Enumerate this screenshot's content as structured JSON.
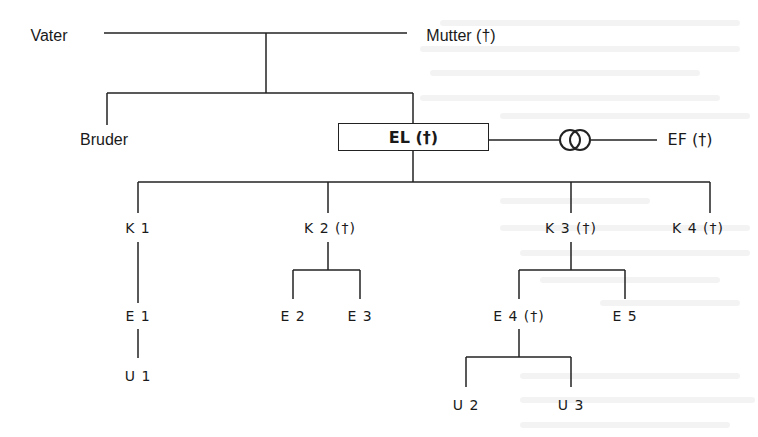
{
  "diagram": {
    "type": "family-tree (genogram)",
    "colors": {
      "line": "#222222",
      "text": "#1a1a1a",
      "background": "#ffffff"
    },
    "parents": {
      "father": {
        "label": "Vater"
      },
      "mother": {
        "label": "Mutter (†)"
      }
    },
    "siblings": [
      {
        "label": "Bruder"
      },
      {
        "label": "EL (†)",
        "highlighted": true
      }
    ],
    "spouse": {
      "label": "EF (†)",
      "relation_symbol": "marriage-rings-icon"
    },
    "children": [
      {
        "label": "K 1"
      },
      {
        "label": "K 2 (†)"
      },
      {
        "label": "K 3 (†)"
      },
      {
        "label": "K 4 (†)"
      }
    ],
    "grandchildren": [
      {
        "label": "E 1",
        "parent": "K 1"
      },
      {
        "label": "E 2",
        "parent": "K 2 (†)"
      },
      {
        "label": "E 3",
        "parent": "K 2 (†)"
      },
      {
        "label": "E 4 (†)",
        "parent": "K 3 (†)"
      },
      {
        "label": "E 5",
        "parent": "K 3 (†)"
      }
    ],
    "great_grandchildren": [
      {
        "label": "U 1",
        "parent": "E 1"
      },
      {
        "label": "U 2",
        "parent": "E 4 (†)"
      },
      {
        "label": "U 3",
        "parent": "E 4 (†)"
      }
    ]
  }
}
